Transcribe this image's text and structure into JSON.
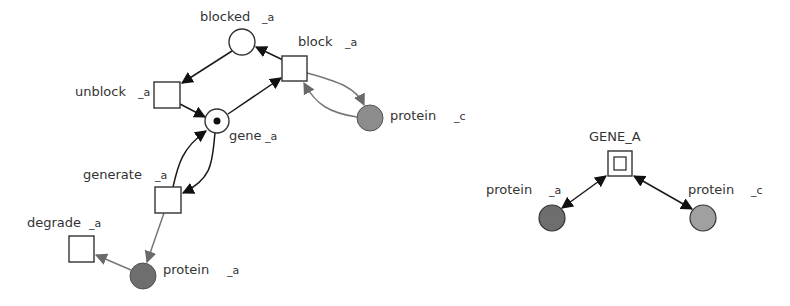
{
  "left_network": {
    "places": [
      {
        "id": "blocked_a",
        "label": "blocked",
        "suffix": "_a",
        "cx": 242,
        "cy": 42,
        "r": 13,
        "fill": "#ffffff",
        "token": false
      },
      {
        "id": "gene_a",
        "label": "gene",
        "suffix": "_a",
        "cx": 217,
        "cy": 121,
        "r": 12,
        "fill": "#ffffff",
        "token": true
      },
      {
        "id": "protein_c",
        "label": "protein",
        "suffix": "_c",
        "cx": 370,
        "cy": 118,
        "r": 13,
        "fill": "#8c8c8c",
        "token": false
      },
      {
        "id": "protein_a",
        "label": "protein",
        "suffix": "_a",
        "cx": 143,
        "cy": 276,
        "r": 13,
        "fill": "#6e6e6e",
        "token": false
      }
    ],
    "transitions": [
      {
        "id": "block_a",
        "label": "block",
        "suffix": "_a",
        "x": 282,
        "y": 56,
        "w": 25,
        "h": 25
      },
      {
        "id": "unblock_a",
        "label": "unblock",
        "suffix": "_a",
        "x": 154,
        "y": 82,
        "w": 26,
        "h": 26
      },
      {
        "id": "generate_a",
        "label": "generate",
        "suffix": "_a",
        "x": 155,
        "y": 187,
        "w": 26,
        "h": 26
      },
      {
        "id": "degrade_a",
        "label": "degrade",
        "suffix": "_a",
        "x": 69,
        "y": 236,
        "w": 25,
        "h": 26
      }
    ],
    "arcs": [
      {
        "from": "block_a",
        "to": "blocked_a",
        "style": "dark"
      },
      {
        "from": "blocked_a",
        "to": "unblock_a",
        "style": "dark"
      },
      {
        "from": "unblock_a",
        "to": "gene_a",
        "style": "dark"
      },
      {
        "from": "gene_a",
        "to": "block_a",
        "style": "dark"
      },
      {
        "from": "generate_a",
        "to": "gene_a",
        "style": "dark"
      },
      {
        "from": "gene_a",
        "to": "generate_a",
        "style": "dark"
      },
      {
        "from": "block_a",
        "to": "protein_c",
        "style": "gray"
      },
      {
        "from": "protein_c",
        "to": "block_a",
        "style": "gray"
      },
      {
        "from": "generate_a",
        "to": "protein_a",
        "style": "gray"
      },
      {
        "from": "protein_a",
        "to": "degrade_a",
        "style": "gray"
      }
    ]
  },
  "right_network": {
    "gene": {
      "id": "GENE_A",
      "label": "GENE_A",
      "x": 608,
      "y": 151,
      "w": 24,
      "h": 25
    },
    "proteins": [
      {
        "id": "protein_a",
        "label": "protein",
        "suffix": "_a",
        "cx": 552,
        "cy": 218,
        "r": 13,
        "fill": "#6e6e6e"
      },
      {
        "id": "protein_c",
        "label": "protein",
        "suffix": "_c",
        "cx": 703,
        "cy": 218,
        "r": 13,
        "fill": "#a0a0a0"
      }
    ],
    "edges": [
      {
        "between": [
          "GENE_A",
          "protein_a"
        ],
        "type": "bidirectional"
      },
      {
        "between": [
          "GENE_A",
          "protein_c"
        ],
        "type": "bidirectional"
      }
    ]
  },
  "colors": {
    "stroke": "#333333",
    "arc_dark": "#1a1a1a",
    "arc_gray": "#777777",
    "protein_a_fill": "#6e6e6e",
    "protein_c_fill": "#8c8c8c",
    "right_protein_c_fill": "#a0a0a0",
    "token": "#111111"
  }
}
